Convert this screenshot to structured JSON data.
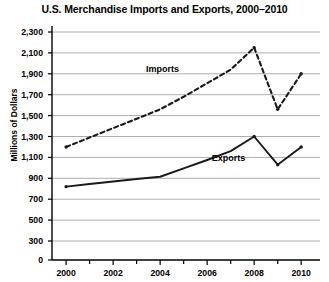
{
  "chart_data": {
    "type": "line",
    "title": "U.S. Merchandise Imports and Exports, 2000–2010",
    "xlabel": "",
    "ylabel": "Millions of Dollars",
    "x": [
      2000,
      2001,
      2002,
      2003,
      2004,
      2005,
      2006,
      2007,
      2008,
      2009,
      2010
    ],
    "xlim": [
      1999.4,
      2010.8
    ],
    "ylim": [
      0,
      2300
    ],
    "xticks": [
      2000,
      2002,
      2004,
      2006,
      2008,
      2010
    ],
    "xtick_labels": [
      "2000",
      "2002",
      "2004",
      "2006",
      "2008",
      "2010"
    ],
    "yticks": [
      0,
      300,
      500,
      700,
      900,
      1100,
      1300,
      1500,
      1700,
      1900,
      2100,
      2300
    ],
    "ytick_labels": [
      "0",
      "300",
      "500",
      "700",
      "900",
      "1,100",
      "1,300",
      "1,500",
      "1,700",
      "1,900",
      "2,100",
      "2,300"
    ],
    "y_axis_note": "Axis is broken between 0 and 300; ticks from 300 upward are evenly spaced at 200 intervals",
    "grid": true,
    "grid_axis": "y",
    "legend": "inline-labels",
    "series": [
      {
        "name": "Imports",
        "style": "dashed",
        "color": "#1a1a1a",
        "values": [
          1200,
          1290,
          1380,
          1470,
          1560,
          1680,
          1810,
          1940,
          2150,
          1560,
          1900
        ]
      },
      {
        "name": "Exports",
        "style": "solid",
        "color": "#1a1a1a",
        "values": [
          820,
          845,
          870,
          893,
          915,
          995,
          1075,
          1160,
          1300,
          1030,
          1200
        ]
      }
    ],
    "annotations": [
      {
        "text": "Imports",
        "x": 2003.4,
        "y": 1935
      },
      {
        "text": "Exports",
        "x": 2006.2,
        "y": 1085
      }
    ]
  },
  "colors": {
    "axis": "#000000",
    "grid": "#999999",
    "series": "#1a1a1a",
    "background": "#ffffff"
  }
}
